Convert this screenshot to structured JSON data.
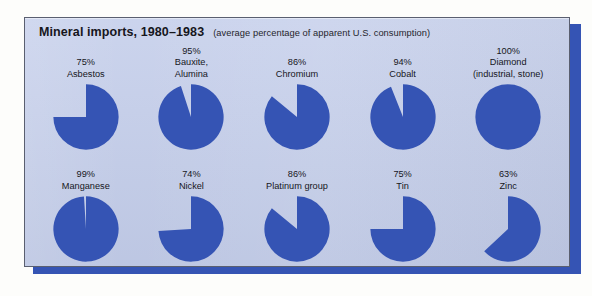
{
  "figure": {
    "title": "Mineral imports, 1980–1983",
    "subtitle": "(average percentage of apparent U.S. consumption)",
    "panel_color": "#c3cdea",
    "pie_color": "#3554b4",
    "shadow_color": "#3554b4",
    "border_color": "#5a5f70"
  },
  "chart_data": {
    "type": "pie",
    "title": "Mineral imports, 1980–1983",
    "subtitle": "(average percentage of apparent U.S. consumption)",
    "xlabel": "",
    "ylabel": "",
    "value_unit": "%",
    "note": "Each pie shows the percentage of U.S. apparent consumption supplied by imports; the filled wedge begins at 12 o'clock and sweeps clockwise.",
    "categories": [
      "Asbestos",
      "Bauxite, Alumina",
      "Chromium",
      "Cobalt",
      "Diamond (industrial, stone)",
      "Manganese",
      "Nickel",
      "Platinum group",
      "Tin",
      "Zinc"
    ],
    "values": [
      75,
      95,
      86,
      94,
      100,
      99,
      74,
      86,
      75,
      63
    ],
    "rows": [
      [
        {
          "pct": "75%",
          "pct_value": 75,
          "name_lines": [
            "Asbestos"
          ]
        },
        {
          "pct": "95%",
          "pct_value": 95,
          "name_lines": [
            "Bauxite,",
            "Alumina"
          ]
        },
        {
          "pct": "86%",
          "pct_value": 86,
          "name_lines": [
            "Chromium"
          ]
        },
        {
          "pct": "94%",
          "pct_value": 94,
          "name_lines": [
            "Cobalt"
          ]
        },
        {
          "pct": "100%",
          "pct_value": 100,
          "name_lines": [
            "Diamond",
            "(industrial, stone)"
          ]
        }
      ],
      [
        {
          "pct": "99%",
          "pct_value": 99,
          "name_lines": [
            "Manganese"
          ]
        },
        {
          "pct": "74%",
          "pct_value": 74,
          "name_lines": [
            "Nickel"
          ]
        },
        {
          "pct": "86%",
          "pct_value": 86,
          "name_lines": [
            "Platinum group"
          ]
        },
        {
          "pct": "75%",
          "pct_value": 75,
          "name_lines": [
            "Tin"
          ]
        },
        {
          "pct": "63%",
          "pct_value": 63,
          "name_lines": [
            "Zinc"
          ]
        }
      ]
    ]
  }
}
